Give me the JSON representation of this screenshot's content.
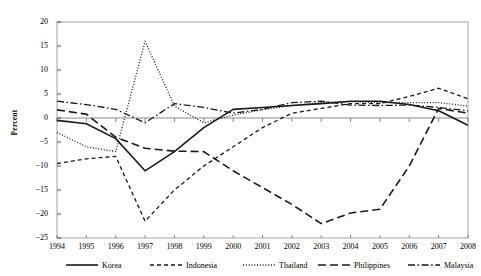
{
  "chart_data": {
    "type": "line",
    "title": "",
    "xlabel": "",
    "ylabel": "Percent",
    "ylim": [
      -25,
      20
    ],
    "ytick_values": [
      20,
      15,
      10,
      5,
      0,
      -5,
      -10,
      -15,
      -20,
      -25
    ],
    "ytick_labels": [
      "20",
      "15",
      "10",
      "5",
      "0",
      "−5",
      "−10",
      "−15",
      "−20",
      "−25"
    ],
    "grid": false,
    "zero_line": true,
    "legend_position": "bottom",
    "categories": [
      "1994",
      "1995",
      "1996",
      "1997",
      "1998",
      "1999",
      "2000",
      "2001",
      "2002",
      "2003",
      "2004",
      "2005",
      "2006",
      "2007",
      "2008"
    ],
    "series": [
      {
        "name": "Korea",
        "style": "solid",
        "values": [
          -0.5,
          -1.2,
          -4.3,
          -11.0,
          -7.0,
          -2.0,
          1.8,
          2.2,
          2.6,
          3.0,
          3.5,
          3.5,
          2.8,
          1.5,
          -1.5
        ]
      },
      {
        "name": "Indonesia",
        "style": "short-dash",
        "values": [
          -9.5,
          -8.5,
          -8.0,
          -21.5,
          -15.0,
          -10.0,
          -6.0,
          -2.0,
          1.0,
          2.0,
          3.0,
          3.0,
          4.5,
          6.2,
          4.0
        ]
      },
      {
        "name": "Thailand",
        "style": "dotted",
        "values": [
          -3.0,
          -6.0,
          -7.0,
          16.0,
          2.5,
          -1.0,
          0.6,
          1.7,
          2.6,
          3.2,
          3.4,
          3.2,
          3.2,
          3.2,
          2.5
        ]
      },
      {
        "name": "Philippines",
        "style": "long-dash",
        "values": [
          1.7,
          0.8,
          -4.0,
          -6.3,
          -6.9,
          -7.0,
          -11.0,
          -14.5,
          -18.0,
          -22.0,
          -19.8,
          -19.0,
          -10.0,
          2.0,
          1.0
        ]
      },
      {
        "name": "Malaysia",
        "style": "dash-dot",
        "values": [
          3.5,
          2.8,
          1.8,
          -1.0,
          3.0,
          2.2,
          1.0,
          1.8,
          3.2,
          3.5,
          2.7,
          2.6,
          2.7,
          2.2,
          1.5
        ]
      }
    ]
  },
  "legend": {
    "items": [
      {
        "label": "Korea"
      },
      {
        "label": "Indonesia"
      },
      {
        "label": "Thailand"
      },
      {
        "label": "Philippines"
      },
      {
        "label": "Malaysia"
      }
    ]
  }
}
